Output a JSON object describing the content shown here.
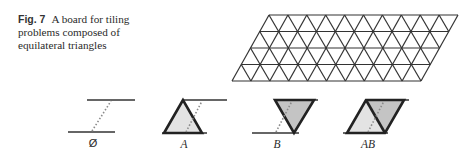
{
  "caption": {
    "figure_number": "Fig. 7",
    "line1": "A board for tiling",
    "line2": "problems composed of",
    "line3": "equilateral triangles"
  },
  "board": {
    "rows": 4,
    "triangles_per_row_edge": 10,
    "top_left": [
      269,
      15
    ],
    "top_right": [
      458,
      15
    ],
    "bottom_left": [
      232,
      81
    ],
    "bottom_right": [
      420,
      81
    ],
    "stroke_color": "#333333"
  },
  "tiles": [
    {
      "id": "empty",
      "label": "Ø",
      "x": 93,
      "shape": "none"
    },
    {
      "id": "A",
      "label": "A",
      "x": 184,
      "shape": "up-triangle",
      "fill": "#e3e3e3"
    },
    {
      "id": "B",
      "label": "B",
      "x": 277,
      "shape": "down-triangle",
      "fill": "#c4c4c4"
    },
    {
      "id": "AB",
      "label": "AB",
      "x": 368,
      "shape": "parallelogram",
      "fill_left": "#e3e3e3",
      "fill_right": "#c4c4c4"
    }
  ],
  "colors": {
    "line": "#333333",
    "dotted": "#8a8a8a",
    "light_fill": "#e3e3e3",
    "dark_fill": "#c4c4c4"
  }
}
